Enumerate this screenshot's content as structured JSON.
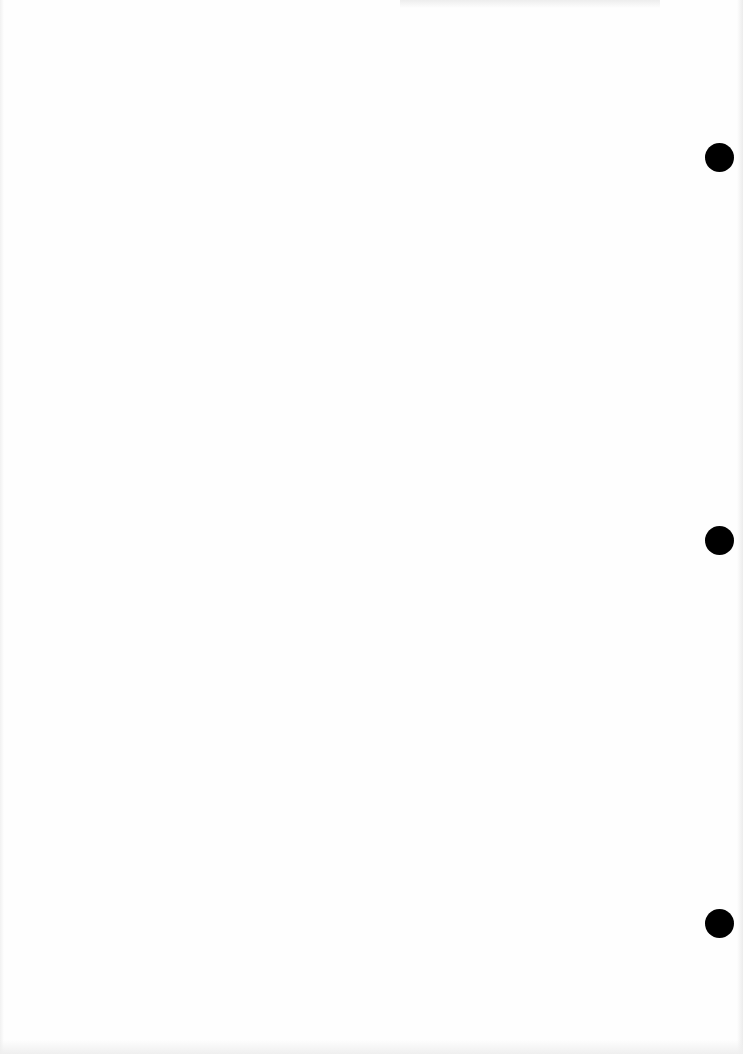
{
  "document": {
    "type": "blank scanned page",
    "background_color": "#fefefe",
    "punch_holes": [
      {
        "cx": 719,
        "cy": 157
      },
      {
        "cx": 719,
        "cy": 540
      },
      {
        "cx": 719,
        "cy": 923
      }
    ],
    "hole_color": "#000000",
    "hole_diameter": 29
  }
}
